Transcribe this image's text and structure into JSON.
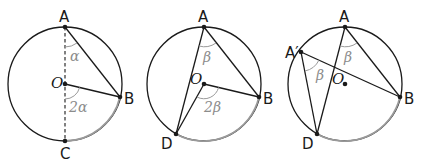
{
  "figure": {
    "colors": {
      "stroke": "#1a1a1a",
      "arc_highlight": "#9a9a9a",
      "angle_label": "#8c8c8c"
    },
    "panels": [
      {
        "id": "panel-1",
        "center_label": "O",
        "points": {
          "A": "A",
          "B": "B",
          "C": "C"
        },
        "angle_inscribed": "α",
        "angle_central": "2α",
        "diameter": "AC (dashed)"
      },
      {
        "id": "panel-2",
        "center_label": "O",
        "points": {
          "A": "A",
          "B": "B",
          "D": "D"
        },
        "angle_inscribed": "β",
        "angle_central": "2β"
      },
      {
        "id": "panel-3",
        "center_label": "O",
        "points": {
          "A": "A",
          "A_prime": "A′",
          "B": "B",
          "D": "D"
        },
        "angle_inscribed_1": "β",
        "angle_inscribed_2": "β"
      }
    ]
  }
}
